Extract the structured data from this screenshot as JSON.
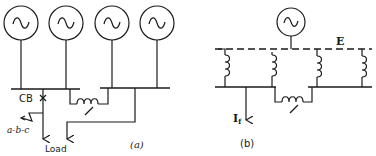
{
  "diagram_a": {
    "caption": "(a)",
    "generator_count": 4,
    "labels": {
      "breaker": "CB",
      "fault": "a-b-c",
      "load": "Load",
      "reactor": "X"
    }
  },
  "diagram_b": {
    "caption": "(b)",
    "labels": {
      "voltage": "E",
      "fault_current": "I",
      "fault_current_sub": "f",
      "reactor": "X"
    }
  }
}
